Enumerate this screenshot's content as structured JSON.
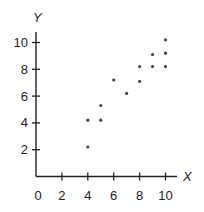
{
  "chart_data": {
    "type": "scatter",
    "title": "",
    "xlabel": "X",
    "ylabel": "Y",
    "xlim": [
      0,
      11
    ],
    "ylim": [
      0,
      11
    ],
    "grid": false,
    "legend": null,
    "x_ticks": [
      2,
      4,
      6,
      8,
      10
    ],
    "y_ticks": [
      2,
      4,
      6,
      8,
      10
    ],
    "x_tick_labels": [
      "0",
      "2",
      "4",
      "6",
      "8",
      "10"
    ],
    "y_tick_labels": [
      "2",
      "4",
      "6",
      "8",
      "10"
    ],
    "series": [
      {
        "name": "data",
        "color": "#444444",
        "points": [
          {
            "x": 4,
            "y": 2.2
          },
          {
            "x": 4,
            "y": 4.2
          },
          {
            "x": 5,
            "y": 4.2
          },
          {
            "x": 5,
            "y": 5.3
          },
          {
            "x": 6,
            "y": 7.2
          },
          {
            "x": 7,
            "y": 6.2
          },
          {
            "x": 8,
            "y": 7.1
          },
          {
            "x": 8,
            "y": 8.2
          },
          {
            "x": 9,
            "y": 8.2
          },
          {
            "x": 9,
            "y": 9.1
          },
          {
            "x": 10,
            "y": 8.2
          },
          {
            "x": 10,
            "y": 9.2
          },
          {
            "x": 10,
            "y": 10.2
          }
        ]
      }
    ]
  },
  "colors": {
    "axis": "#222222",
    "point": "#444444",
    "background": "#ffffff"
  }
}
